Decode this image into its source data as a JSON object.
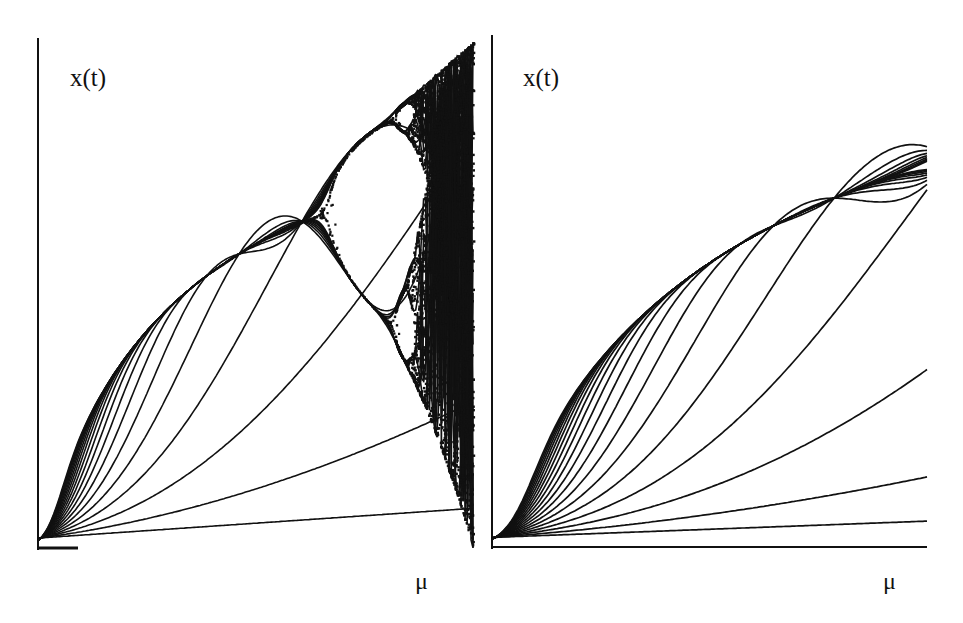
{
  "chart_data": [
    {
      "type": "line",
      "title": "",
      "panel": "left",
      "xlabel": "μ",
      "ylabel": "x(t)",
      "grid": false,
      "legend": null,
      "xlim": [
        0,
        1
      ],
      "ylim": [
        0,
        1
      ],
      "description": "Family of iterates x(t) versus parameter μ for successive t; curves fan out from origin, converge onto a parabolic envelope, then bifurcate into period-doubling and chaotic region near right edge",
      "num_curves": 20,
      "series_endpoints_y_at_right_edge": [
        0.02,
        0.13,
        0.32,
        0.55,
        0.72,
        0.83,
        0.9
      ],
      "envelope_max_y": 0.99,
      "chaotic_band_x_range": [
        0.82,
        1.0
      ]
    },
    {
      "type": "line",
      "title": "",
      "panel": "right",
      "xlabel": "μ",
      "ylabel": "x(t)",
      "grid": false,
      "legend": null,
      "xlim": [
        0,
        1
      ],
      "ylim": [
        0,
        1
      ],
      "description": "Family of iterates x(t) versus μ converging monotonically onto a smooth saturating envelope without bifurcation",
      "num_curves": 20,
      "series_endpoints_y_at_right_edge": [
        0.005,
        0.04,
        0.15,
        0.29,
        0.57,
        0.72,
        0.76,
        0.77,
        0.78
      ],
      "envelope_max_y": 0.78
    }
  ],
  "left": {
    "ylabel": "x(t)",
    "xlabel": "μ"
  },
  "right": {
    "ylabel": "x(t)",
    "xlabel": "μ"
  }
}
